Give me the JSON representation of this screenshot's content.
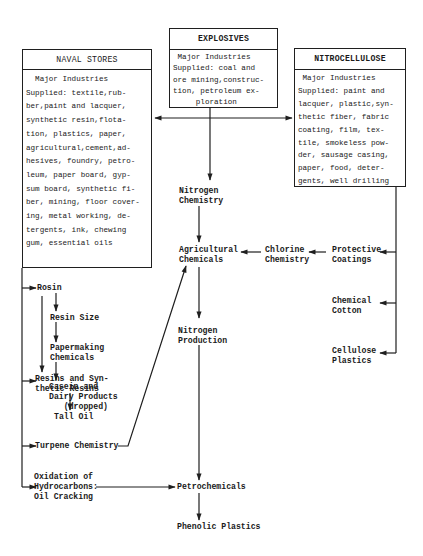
{
  "boxes": {
    "naval_stores": {
      "title": "NAVAL STORES",
      "body": "  Major Industries\nSupplied: textile,rub-\nber,paint and lacquer,\nsynthetic resin,flota-\ntion, plastics, paper,\nagricultural,cement,ad-\nhesives, foundry, petro-\nleum, paper board, gyp-\nsum board, synthetic fi-\nber, mining, floor cover-\ning, metal working, de-\ntergents, ink, chewing\ngum, essential oils"
    },
    "explosives": {
      "title": "EXPLOSIVES",
      "body": " Major Industries\nSupplied: coal and\nore mining,construc-\ntion, petroleum ex-\n     ploration"
    },
    "nitrocellulose": {
      "title": "NITROCELLULOSE",
      "body": " Major Industries\nSupplied: paint and\nlacquer, plastic,syn-\nthetic fiber, fabric\ncoating, film, tex-\ntile, smokeless pow-\nder, sausage casing,\npaper, food, deter-\ngents, well drilling"
    }
  },
  "nodes": {
    "rosin": "Rosin",
    "resin_size": "Resin Size",
    "papermaking": "Papermaking\nChemicals",
    "casein": "Casein and\nDairy Products\n   (dropped)",
    "resins": "Resins and Syn-\nthetic Resins",
    "tall_oil": "Tall Oil",
    "turpene": "Turpene Chemistry",
    "oxidation": "Oxidation of\nHydrocarbons:\nOil Cracking",
    "nitrogen_chemistry": "Nitrogen\nChemistry",
    "agricultural": "Agricultural\nChemicals",
    "chlorine": "Chlorine\nChemistry",
    "protective": "Protective\nCoatings",
    "chemical_cotton": "Chemical\nCotton",
    "cellulose_plastics": "Cellulose\nPlastics",
    "nitrogen_production": "Nitrogen\nProduction",
    "petrochemicals": "Petrochemicals",
    "phenolic": "Phenolic Plastics"
  },
  "colors": {
    "ink": "#1f1f1f",
    "background": "#ffffff"
  }
}
